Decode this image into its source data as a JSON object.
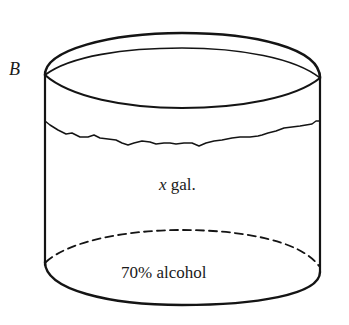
{
  "figure": {
    "type": "cylinder-container",
    "container_label": "B",
    "volume_label_var": "x",
    "volume_label_unit": " gal.",
    "contents_label": "70% alcohol",
    "colors": {
      "line": "#141414",
      "text": "#1a1a1a",
      "background": "#ffffff"
    }
  }
}
